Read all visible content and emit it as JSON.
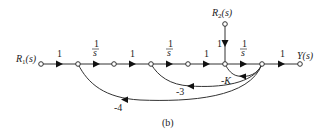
{
  "figure": {
    "caption": "(b)",
    "type": "signal-flow-graph"
  },
  "nodes": [
    {
      "id": "R1",
      "label": "R",
      "sub": "1",
      "arg": "(s)",
      "x": 41,
      "y": 64
    },
    {
      "id": "n2",
      "x": 78,
      "y": 64
    },
    {
      "id": "n3",
      "x": 114,
      "y": 64
    },
    {
      "id": "n4",
      "x": 151,
      "y": 64
    },
    {
      "id": "n5",
      "x": 188,
      "y": 64
    },
    {
      "id": "n6",
      "x": 225,
      "y": 64
    },
    {
      "id": "n7",
      "x": 262,
      "y": 64
    },
    {
      "id": "Y",
      "label": "Y(s)",
      "x": 300,
      "y": 64
    },
    {
      "id": "R2",
      "label": "R",
      "sub": "2",
      "arg": "(s)",
      "x": 225,
      "y": 24
    }
  ],
  "branches": [
    {
      "from": "R1",
      "to": "n2",
      "gain": "1"
    },
    {
      "from": "n2",
      "to": "n3",
      "gain": "1/s",
      "num": "1",
      "den": "s"
    },
    {
      "from": "n3",
      "to": "n4",
      "gain": "1"
    },
    {
      "from": "n4",
      "to": "n5",
      "gain": "1/s",
      "num": "1",
      "den": "s"
    },
    {
      "from": "n5",
      "to": "n6",
      "gain": "1"
    },
    {
      "from": "R2",
      "to": "n6",
      "gain": "1"
    },
    {
      "from": "n6",
      "to": "n7",
      "gain": "1/s",
      "num": "1",
      "den": "s"
    },
    {
      "from": "n7",
      "to": "Y",
      "gain": "1"
    },
    {
      "from": "n7",
      "to": "n6",
      "gain": "-K",
      "type": "feedback"
    },
    {
      "from": "n7",
      "to": "n4",
      "gain": "-3",
      "type": "feedback"
    },
    {
      "from": "n7",
      "to": "n2",
      "gain": "-4",
      "type": "feedback"
    }
  ],
  "labels": {
    "r1": {
      "main": "R",
      "sub": "1",
      "arg": "(s)"
    },
    "r2": {
      "main": "R",
      "sub": "2",
      "arg": "(s)"
    },
    "y": "Y(s)",
    "g_r1_n2": "1",
    "g_n2_n3_num": "1",
    "g_n2_n3_den": "s",
    "g_n3_n4": "1",
    "g_n4_n5_num": "1",
    "g_n4_n5_den": "s",
    "g_n5_n6": "1",
    "g_r2_n6": "1",
    "g_n6_n7_num": "1",
    "g_n6_n7_den": "s",
    "g_n7_y": "1",
    "fb_k": "-K",
    "fb_3": "-3",
    "fb_4": "-4"
  }
}
